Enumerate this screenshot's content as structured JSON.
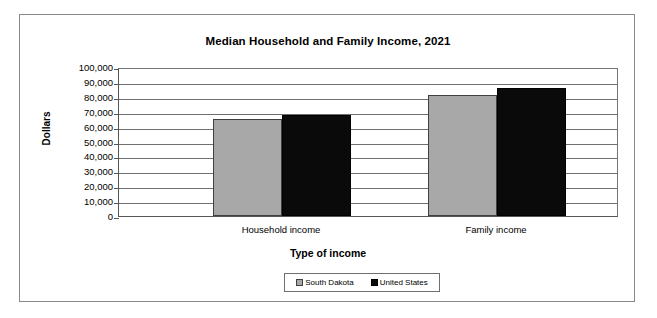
{
  "chart_data": {
    "type": "bar",
    "title": "Median Household and Family Income, 2021",
    "xlabel": "Type of income",
    "ylabel": "Dollars",
    "categories": [
      "Household income",
      "Family income"
    ],
    "series": [
      {
        "name": "South Dakota",
        "color": "#a8a8a8",
        "values": [
          65000,
          81500
        ]
      },
      {
        "name": "United States",
        "color": "#0a0a0a",
        "values": [
          67500,
          85800
        ]
      }
    ],
    "ylim": [
      0,
      100000
    ],
    "ytick_values": [
      0,
      10000,
      20000,
      30000,
      40000,
      50000,
      60000,
      70000,
      80000,
      90000,
      100000
    ],
    "ytick_labels": [
      "0",
      "10,000",
      "20,000",
      "30,000",
      "40,000",
      "50,000",
      "60,000",
      "70,000",
      "80,000",
      "90,000",
      "100,000"
    ],
    "grid": true,
    "legend_position": "bottom"
  },
  "legend": {
    "items": [
      {
        "label": "South Dakota"
      },
      {
        "label": "United States"
      }
    ]
  }
}
